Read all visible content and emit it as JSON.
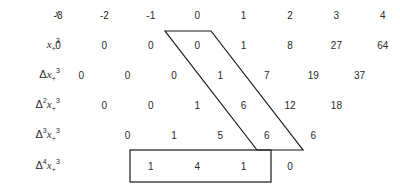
{
  "rows": [
    {
      "name": "x",
      "label_parts": {
        "delta": "",
        "delta_power": "",
        "var": "x",
        "sub": "",
        "sup": ""
      },
      "values": [
        "-3",
        "-2",
        "-1",
        "0",
        "1",
        "2",
        "3",
        "4"
      ],
      "offset": 0
    },
    {
      "name": "x-plus-cubed",
      "label_parts": {
        "delta": "",
        "delta_power": "",
        "var": "x",
        "sub": "+",
        "sup": "3"
      },
      "values": [
        "0",
        "0",
        "0",
        "0",
        "1",
        "8",
        "27",
        "64"
      ],
      "offset": 0
    },
    {
      "name": "delta-1",
      "label_parts": {
        "delta": "Δ",
        "delta_power": "",
        "var": "x",
        "sub": "+",
        "sup": "3"
      },
      "values": [
        "0",
        "0",
        "0",
        "1",
        "7",
        "19",
        "37"
      ],
      "offset": 1
    },
    {
      "name": "delta-2",
      "label_parts": {
        "delta": "Δ",
        "delta_power": "2",
        "var": "x",
        "sub": "+",
        "sup": "3"
      },
      "values": [
        "0",
        "0",
        "1",
        "6",
        "12",
        "18"
      ],
      "offset": 2
    },
    {
      "name": "delta-3",
      "label_parts": {
        "delta": "Δ",
        "delta_power": "3",
        "var": "x",
        "sub": "+",
        "sup": "3"
      },
      "values": [
        "0",
        "1",
        "5",
        "6",
        "6"
      ],
      "offset": 3
    },
    {
      "name": "delta-4",
      "label_parts": {
        "delta": "Δ",
        "delta_power": "4",
        "var": "x",
        "sub": "+",
        "sup": "3"
      },
      "values": [
        "1",
        "4",
        "1",
        "0"
      ],
      "offset": 4
    }
  ],
  "highlights": {
    "parallelogram": "diagonal band from x_+^3 at x=0 down through Δ^3 x_+^3",
    "rectangle": "box around Δ^4 x_+^3 values 1, 4, 1"
  },
  "colors": {
    "ink": "#2a2a2a",
    "background": "#ffffff"
  }
}
